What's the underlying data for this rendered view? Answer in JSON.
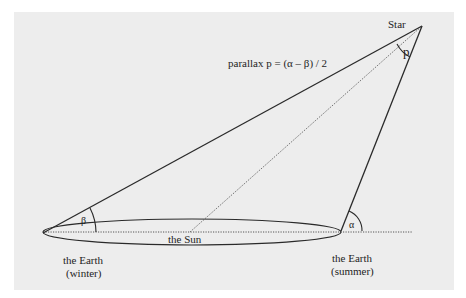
{
  "diagram": {
    "formula": "parallax  p = (α – β) / 2",
    "labels": {
      "star": "Star",
      "sun": "the Sun",
      "earth_winter_line1": "the Earth",
      "earth_winter_line2": "(winter)",
      "earth_summer_line1": "the Earth",
      "earth_summer_line2": "(summer)",
      "angle_p": "p",
      "angle_alpha": "α",
      "angle_beta": "β"
    },
    "colors": {
      "background": "#ededed",
      "stroke": "#2a2a2a",
      "text": "#1e1e1e"
    }
  }
}
